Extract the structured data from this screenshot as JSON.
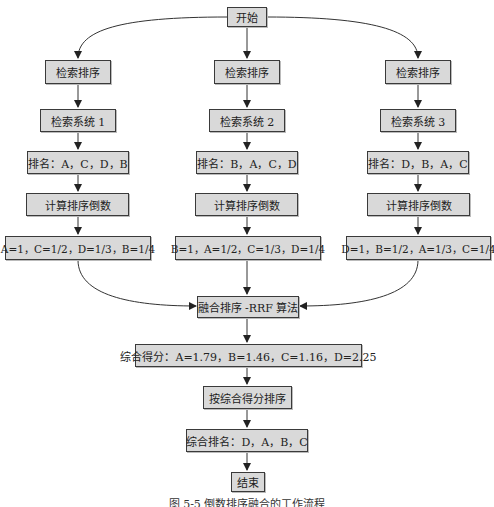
{
  "start": "开始",
  "branches": [
    {
      "step1": "检索排序",
      "system": "检索系统 1",
      "ranking": "排名：A，C，D，B",
      "compute": "计算排序倒数",
      "reciprocals": "A=1，C=1/2，D=1/3，B=1/4"
    },
    {
      "step1": "检索排序",
      "system": "检索系统 2",
      "ranking": "排名：B，A，C，D",
      "compute": "计算排序倒数",
      "reciprocals": "B=1，A=1/2，C=1/3，D=1/4"
    },
    {
      "step1": "检索排序",
      "system": "检索系统 3",
      "ranking": "排名：D，B，A，C",
      "compute": "计算排序倒数",
      "reciprocals": "D=1，B=1/2，A=1/3，C=1/4"
    }
  ],
  "fusion": "融合排序 -RRF 算法",
  "scores": "综合得分：A=1.79，B=1.46，C=1.16，D=2.25",
  "sort_by_score": "按综合得分排序",
  "final_ranking": "综合排名：D，A，B，C",
  "end": "结束",
  "caption": "图 5-5  倒数排序融合的工作流程",
  "colors": {
    "box_fill": "#d9d9d9",
    "box_border": "#3a3a3a",
    "line": "#333333"
  }
}
